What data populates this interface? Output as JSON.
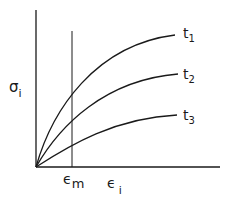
{
  "diagram": {
    "type": "stress-strain isochronous curves",
    "y_axis": {
      "symbol": "σ",
      "subscript": "i"
    },
    "x_axis": {
      "symbol": "ϵ",
      "subscript": "i"
    },
    "marker": {
      "symbol": "ϵ",
      "subscript": "m"
    },
    "curves": [
      {
        "name": "t",
        "subscript": "1"
      },
      {
        "name": "t",
        "subscript": "2"
      },
      {
        "name": "t",
        "subscript": "3"
      }
    ],
    "colors": {
      "line": "#1a1a1a",
      "background": "#ffffff"
    }
  }
}
